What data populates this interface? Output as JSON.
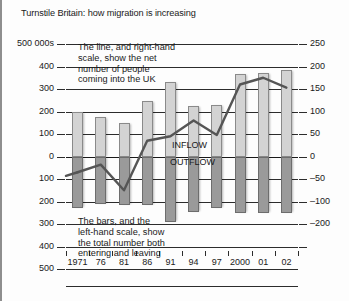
{
  "title": "Turnstile Britain: how migration is increasing",
  "annotations": {
    "line_note": "The line, and right-hand\nscale, show the net\nnumber of people\ncoming into the UK",
    "bars_note": "The bars, and the\nleft-hand scale, show\nthe total number both\nentering and leaving",
    "inflow_label": "INFLOW",
    "outflow_label": "OUTFLOW"
  },
  "axes": {
    "left_unit_label": "500 000s",
    "left_ticks": [
      "500 000s",
      "400",
      "300",
      "200",
      "100",
      "0",
      "100",
      "200",
      "300",
      "400",
      "500"
    ],
    "right_ticks": [
      "250",
      "200",
      "150",
      "100",
      "50",
      "0",
      "–50",
      "–100",
      "–200"
    ]
  },
  "colors": {
    "inflow_bar": "#d3d3d3",
    "outflow_bar": "#9a9a9a",
    "net_line": "#555555",
    "axis": "#2c2c2c",
    "background": "#fdfdfd"
  },
  "chart_data": {
    "type": "bar",
    "title": "Turnstile Britain: how migration is increasing",
    "xlabel": "",
    "ylabel": "500 000s",
    "categories": [
      "1971",
      "76",
      "81",
      "86",
      "91",
      "94",
      "97",
      "2000",
      "01",
      "02"
    ],
    "ylim": [
      -500,
      500
    ],
    "y2lim": [
      -250,
      250
    ],
    "grid": true,
    "legend": "inline-annotation",
    "series": [
      {
        "name": "INFLOW",
        "type": "bar",
        "axis": "left",
        "values": [
          200,
          175,
          150,
          245,
          330,
          225,
          230,
          365,
          370,
          385
        ]
      },
      {
        "name": "OUTFLOW",
        "type": "bar",
        "axis": "left",
        "values": [
          -230,
          -210,
          -215,
          -215,
          -290,
          -245,
          -230,
          -250,
          -250,
          -250
        ]
      },
      {
        "name": "Net migration",
        "type": "line",
        "axis": "right",
        "values": [
          -35,
          -18,
          -75,
          35,
          45,
          80,
          48,
          160,
          175,
          153
        ]
      }
    ]
  }
}
